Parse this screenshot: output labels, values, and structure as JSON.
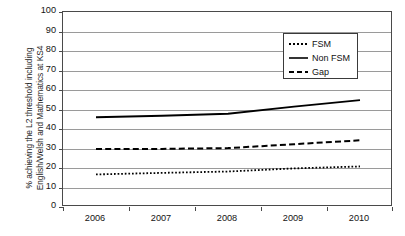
{
  "chart_data": {
    "type": "line",
    "title": "",
    "subtitle": "",
    "xlabel": "",
    "ylabel": "% achieving the L2 threshold including\nEnglish/Welsh and Mathematics at KS4",
    "categories": [
      "2006",
      "2007",
      "2008",
      "2009",
      "2010"
    ],
    "x": [
      2006,
      2007,
      2008,
      2009,
      2010
    ],
    "ylim": [
      0,
      100
    ],
    "ytick_labels": [
      "0",
      "10",
      "20",
      "30",
      "40",
      "50",
      "60",
      "70",
      "80",
      "90",
      "100"
    ],
    "ytick_values": [
      0,
      10,
      20,
      30,
      40,
      50,
      60,
      70,
      80,
      90,
      100
    ],
    "grid": "horizontal",
    "legend_position": "upper-right-inside",
    "series": [
      {
        "name": "FSM",
        "style": "dotted",
        "color": "#000000",
        "values": [
          16.7,
          17.5,
          18.2,
          19.8,
          20.8
        ]
      },
      {
        "name": "Non FSM",
        "style": "solid",
        "color": "#000000",
        "values": [
          46.0,
          46.8,
          47.8,
          51.5,
          54.8
        ]
      },
      {
        "name": "Gap",
        "style": "dashed",
        "color": "#000000",
        "values": [
          29.7,
          29.8,
          30.2,
          32.2,
          34.2
        ]
      }
    ]
  },
  "legend": {
    "items": [
      {
        "label": "FSM",
        "style": "dotted"
      },
      {
        "label": "Non FSM",
        "style": "solid"
      },
      {
        "label": "Gap",
        "style": "dashed"
      }
    ]
  },
  "colors": {
    "axis": "#4a4a4a",
    "grid": "#9a9a9a",
    "line": "#000000",
    "text": "#141414",
    "background": "#ffffff"
  }
}
